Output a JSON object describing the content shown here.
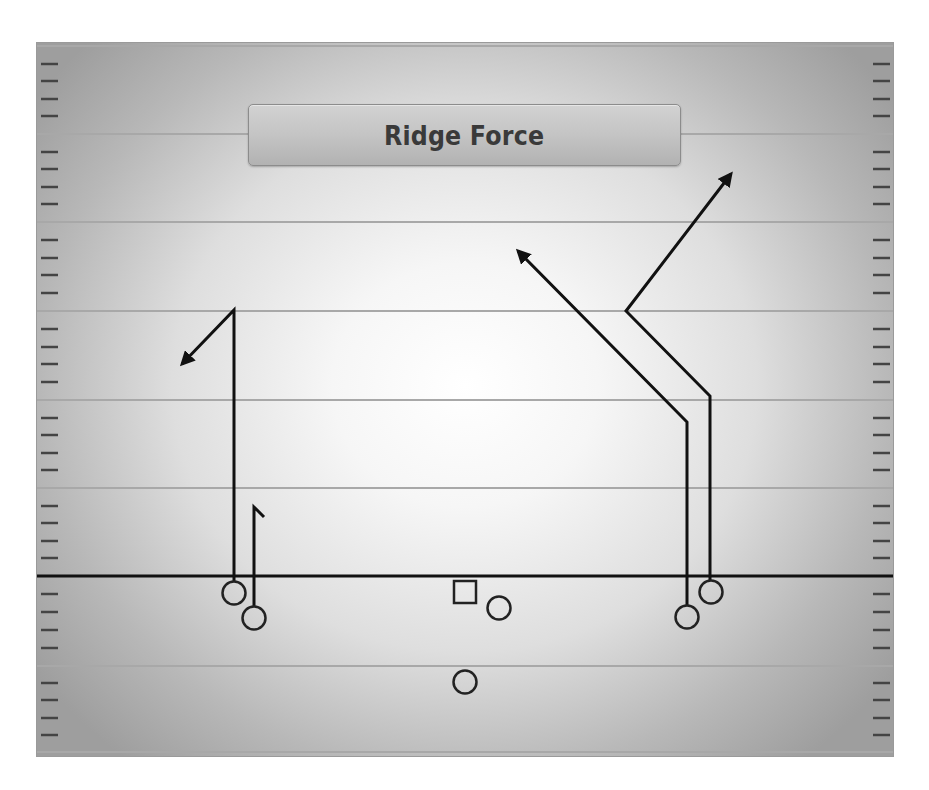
{
  "play": {
    "title": "Ridge Force"
  },
  "colors": {
    "route": "#111111",
    "yard_line": "#a8a8a8",
    "hash_mark": "#444444",
    "line_of_scrimmage": "#111111",
    "player_stroke": "#222222"
  },
  "field": {
    "yard_lines_y": [
      46,
      134,
      222,
      311,
      400,
      488,
      666,
      752
    ],
    "line_of_scrimmage_y": 576
  },
  "players": [
    {
      "id": "wr-left-outside",
      "shape": "circle",
      "x": 234,
      "y": 593
    },
    {
      "id": "wr-left-inside",
      "shape": "circle",
      "x": 254,
      "y": 618
    },
    {
      "id": "center",
      "shape": "square",
      "x": 465,
      "y": 592
    },
    {
      "id": "right-guard",
      "shape": "circle",
      "x": 499,
      "y": 608
    },
    {
      "id": "quarterback",
      "shape": "circle",
      "x": 465,
      "y": 682
    },
    {
      "id": "wr-right-inside",
      "shape": "circle",
      "x": 687,
      "y": 617
    },
    {
      "id": "wr-right-outside",
      "shape": "circle",
      "x": 711,
      "y": 592
    }
  ],
  "routes": [
    {
      "id": "route-left-outside-out",
      "player": "wr-left-outside",
      "points": "234,582 234,310 182,364",
      "arrow": true
    },
    {
      "id": "route-left-inside-hitch",
      "player": "wr-left-inside",
      "points": "254,607 254,507 264,517",
      "arrow": false
    },
    {
      "id": "route-right-inside-post",
      "player": "wr-right-inside",
      "points": "687,606 687,422 518,251",
      "arrow": true
    },
    {
      "id": "route-right-outside-corner",
      "player": "wr-right-outside",
      "points": "710,581 710,396 626,311 731,174",
      "arrow": true
    }
  ]
}
